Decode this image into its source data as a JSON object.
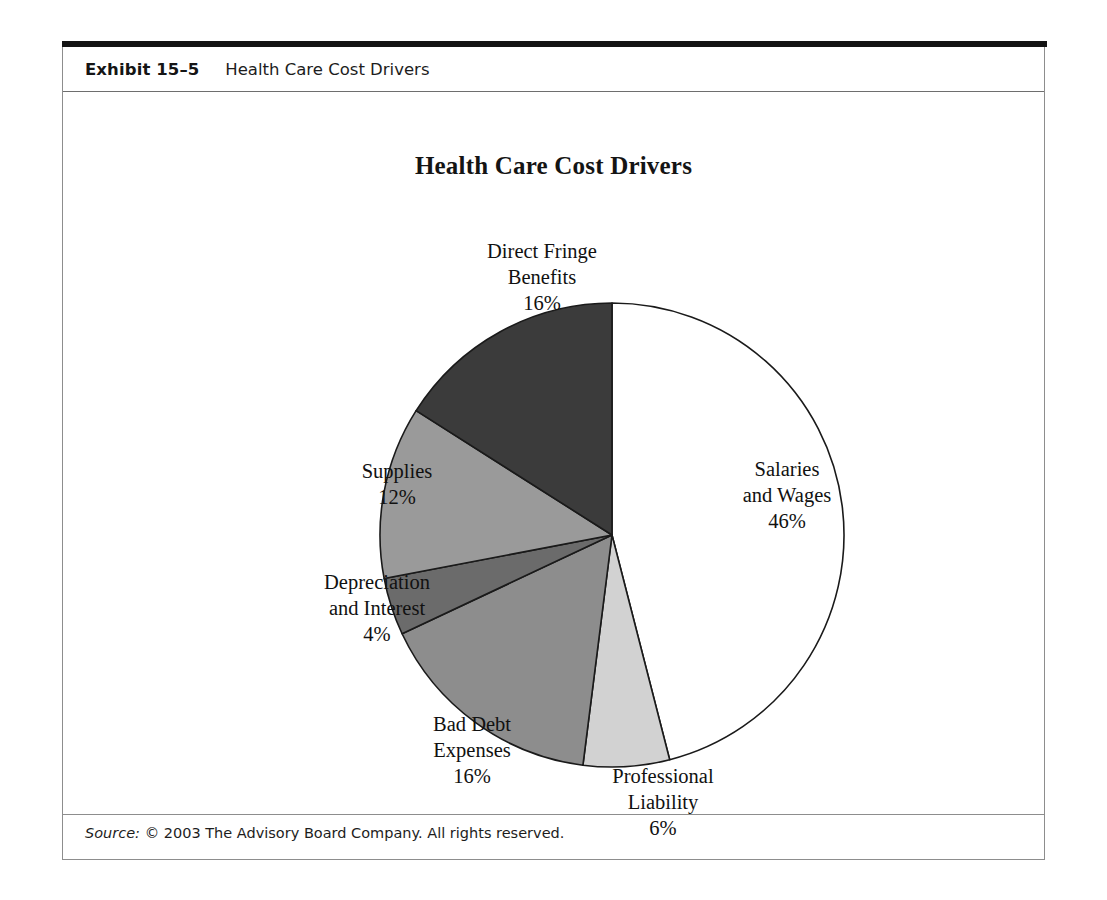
{
  "exhibit": {
    "number": "Exhibit 15–5",
    "caption": "Health Care Cost Drivers"
  },
  "source": {
    "label": "Source:",
    "text": "© 2003 The Advisory Board Company. All rights reserved."
  },
  "chart_data": {
    "type": "pie",
    "title": "Health Care Cost Drivers",
    "xlabel": "",
    "ylabel": "",
    "legend_position": "none",
    "grid": false,
    "unit": "%",
    "start_angle_deg": 0,
    "direction": "clockwise",
    "categories": [
      "Salaries and Wages",
      "Professional Liability",
      "Bad Debt Expenses",
      "Depreciation and Interest",
      "Supplies",
      "Direct Fringe Benefits"
    ],
    "values": [
      46,
      6,
      16,
      4,
      12,
      16
    ],
    "colors": [
      "#ffffff",
      "#d2d2d2",
      "#8d8d8d",
      "#6b6b6b",
      "#9a9a9a",
      "#3b3b3b"
    ],
    "slices": [
      {
        "name": "Salaries and Wages",
        "value": 46,
        "percent_label": "46%",
        "label_lines": [
          "Salaries",
          "and Wages"
        ],
        "color": "#ffffff"
      },
      {
        "name": "Professional Liability",
        "value": 6,
        "percent_label": "6%",
        "label_lines": [
          "Professional",
          "Liability"
        ],
        "color": "#d2d2d2"
      },
      {
        "name": "Bad Debt Expenses",
        "value": 16,
        "percent_label": "16%",
        "label_lines": [
          "Bad Debt",
          "Expenses"
        ],
        "color": "#8d8d8d"
      },
      {
        "name": "Depreciation and Interest",
        "value": 4,
        "percent_label": "4%",
        "label_lines": [
          "Depreciation",
          "and Interest"
        ],
        "color": "#6b6b6b"
      },
      {
        "name": "Supplies",
        "value": 12,
        "percent_label": "12%",
        "label_lines": [
          "Supplies"
        ],
        "color": "#9a9a9a"
      },
      {
        "name": "Direct Fringe Benefits",
        "value": 16,
        "percent_label": "16%",
        "label_lines": [
          "Direct Fringe",
          "Benefits"
        ],
        "color": "#3b3b3b"
      }
    ]
  }
}
